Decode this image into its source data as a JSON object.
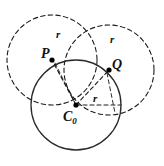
{
  "figure": {
    "type": "geometric-construction",
    "canvas": {
      "width": 164,
      "height": 166
    },
    "colors": {
      "stroke": "#1a1a1a",
      "background": "#ffffff",
      "point_fill": "#000000"
    },
    "common_radius": 45,
    "points": [
      {
        "id": "C0",
        "label": "C",
        "subscript": "0",
        "x": 76,
        "y": 105
      },
      {
        "id": "P",
        "label": "P",
        "subscript": "",
        "x": 52,
        "y": 60
      },
      {
        "id": "Q",
        "label": "Q",
        "subscript": "",
        "x": 109,
        "y": 70
      }
    ],
    "circles": [
      {
        "id": "base-circle",
        "center": "C0",
        "cx": 76,
        "cy": 105,
        "r": 45,
        "style": "solid"
      },
      {
        "id": "circle-at-P",
        "center": "P",
        "cx": 52,
        "cy": 60,
        "r": 45,
        "style": "dashed"
      },
      {
        "id": "circle-at-Q",
        "center": "Q",
        "cx": 109,
        "cy": 70,
        "r": 45,
        "style": "dashed"
      }
    ],
    "radius_segments": [
      {
        "id": "radius-C0-P",
        "from": "C0",
        "to": "P",
        "x1": 76,
        "y1": 105,
        "x2": 52,
        "y2": 60,
        "style": "dashed",
        "label": "r"
      },
      {
        "id": "radius-C0-Q",
        "from": "C0",
        "to": "Q",
        "x1": 76,
        "y1": 105,
        "x2": 109,
        "y2": 70,
        "style": "dashed",
        "label": "r"
      },
      {
        "id": "radius-C0-right",
        "from": "C0",
        "to": "edge",
        "x1": 76,
        "y1": 105,
        "x2": 121,
        "y2": 105,
        "style": "dashed",
        "label": "r"
      },
      {
        "id": "radius-P-down",
        "from": "P",
        "to": "edge",
        "x1": 52,
        "y1": 60,
        "x2": 72,
        "y2": 100,
        "style": "dashed",
        "label": "r"
      },
      {
        "id": "radius-Q-down",
        "from": "Q",
        "to": "edge",
        "x1": 109,
        "y1": 70,
        "x2": 118,
        "y2": 114,
        "style": "dashed",
        "label": "r"
      }
    ],
    "labels": {
      "point_P": "P",
      "point_Q": "Q",
      "point_C": "C",
      "point_C_subscript": "0",
      "radius_left": "r",
      "radius_right": "r",
      "radius_horizontal": "r"
    }
  }
}
